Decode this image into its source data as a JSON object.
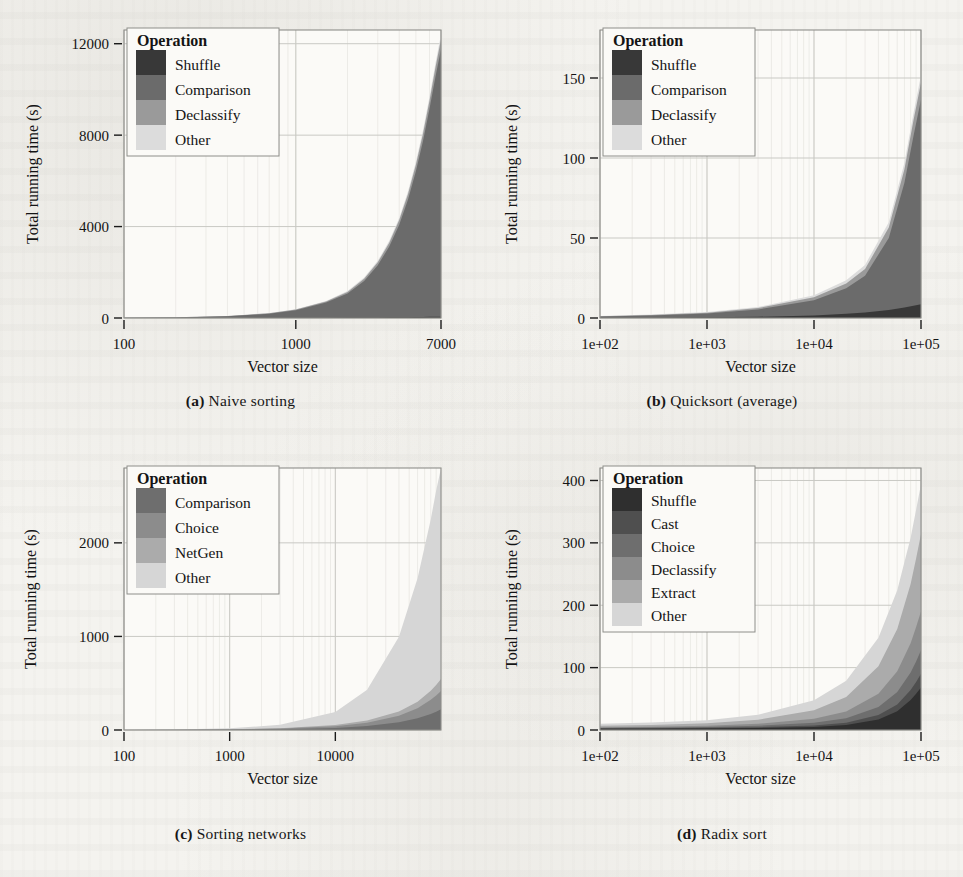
{
  "figure": {
    "background_color": "#f4f3ef",
    "ink_color": "#141414"
  },
  "palette": {
    "g1": "#383838",
    "g2": "#4e4e4e",
    "g3": "#6b6b6b",
    "g4": "#8a8a8a",
    "g5": "#ababab",
    "g6": "#d9d9d9",
    "grid": "#c9c9c4",
    "frame": "#8e8e8a"
  },
  "panels": [
    {
      "id": "a",
      "caption_marker": "(a)",
      "caption_text": "Naive sorting",
      "legend": {
        "title": "Operation",
        "entries": [
          {
            "label": "Shuffle",
            "color": "#383838"
          },
          {
            "label": "Comparison",
            "color": "#6b6b6b"
          },
          {
            "label": "Declassify",
            "color": "#9a9a9a"
          },
          {
            "label": "Other",
            "color": "#dcdcdc"
          }
        ]
      },
      "xlabel": "Vector size",
      "ylabel": "Total running time (s)",
      "xticks": [
        "100",
        "1000",
        "7000"
      ],
      "yticks": [
        "0",
        "4000",
        "8000",
        "12000"
      ]
    },
    {
      "id": "b",
      "caption_marker": "(b)",
      "caption_text": "Quicksort (average)",
      "legend": {
        "title": "Operation",
        "entries": [
          {
            "label": "Shuffle",
            "color": "#383838"
          },
          {
            "label": "Comparison",
            "color": "#6b6b6b"
          },
          {
            "label": "Declassify",
            "color": "#9a9a9a"
          },
          {
            "label": "Other",
            "color": "#dcdcdc"
          }
        ]
      },
      "xlabel": "Vector size",
      "ylabel": "Total running time (s)",
      "xticks": [
        "1e+02",
        "1e+03",
        "1e+04",
        "1e+05"
      ],
      "yticks": [
        "0",
        "50",
        "100",
        "150"
      ]
    },
    {
      "id": "c",
      "caption_marker": "(c)",
      "caption_text": "Sorting networks",
      "legend": {
        "title": "Operation",
        "entries": [
          {
            "label": "Comparison",
            "color": "#6e6e6e"
          },
          {
            "label": "Choice",
            "color": "#8c8c8c"
          },
          {
            "label": "NetGen",
            "color": "#ababab"
          },
          {
            "label": "Other",
            "color": "#d6d6d6"
          }
        ]
      },
      "xlabel": "Vector size",
      "ylabel": "Total running time (s)",
      "xticks": [
        "100",
        "1000",
        "10000"
      ],
      "yticks": [
        "0",
        "1000",
        "2000"
      ]
    },
    {
      "id": "d",
      "caption_marker": "(d)",
      "caption_text": "Radix sort",
      "legend": {
        "title": "Operation",
        "entries": [
          {
            "label": "Shuffle",
            "color": "#2f2f2f"
          },
          {
            "label": "Cast",
            "color": "#4f4f4f"
          },
          {
            "label": "Choice",
            "color": "#6e6e6e"
          },
          {
            "label": "Declassify",
            "color": "#8c8c8c"
          },
          {
            "label": "Extract",
            "color": "#ababab"
          },
          {
            "label": "Other",
            "color": "#d6d6d6"
          }
        ]
      },
      "xlabel": "Vector size",
      "ylabel": "Total running time (s)",
      "xticks": [
        "1e+02",
        "1e+03",
        "1e+04",
        "1e+05"
      ],
      "yticks": [
        "0",
        "100",
        "200",
        "300",
        "400"
      ]
    }
  ],
  "chart_data": [
    {
      "type": "area",
      "panel": "a",
      "title": "(a) Naive sorting",
      "xlabel": "Vector size",
      "ylabel": "Total running time (s)",
      "xscale": "log",
      "xlim": [
        100,
        7000
      ],
      "ylim": [
        0,
        12600
      ],
      "xticks": [
        100,
        1000,
        7000
      ],
      "yticks": [
        0,
        4000,
        8000,
        12000
      ],
      "grid": true,
      "legend": "inside-top-left",
      "legend_title": "Operation",
      "stacked": true,
      "x": [
        100,
        200,
        400,
        700,
        1000,
        1500,
        2000,
        2500,
        3000,
        3500,
        4000,
        4500,
        5000,
        5500,
        6000,
        6500,
        7000
      ],
      "series": [
        {
          "name": "Shuffle",
          "color": "#383838",
          "values": [
            1,
            2,
            4,
            7,
            10,
            14,
            18,
            22,
            26,
            30,
            34,
            38,
            42,
            46,
            50,
            54,
            58
          ]
        },
        {
          "name": "Comparison",
          "color": "#6b6b6b",
          "values": [
            10,
            25,
            70,
            180,
            330,
            660,
            1050,
            1600,
            2280,
            3100,
            4050,
            5150,
            6380,
            7700,
            9100,
            10500,
            11700
          ]
        },
        {
          "name": "Declassify",
          "color": "#9a9a9a",
          "values": [
            2,
            4,
            9,
            18,
            28,
            48,
            72,
            100,
            130,
            165,
            200,
            240,
            280,
            320,
            360,
            400,
            440
          ]
        },
        {
          "name": "Other",
          "color": "#dcdcdc",
          "values": [
            2,
            3,
            6,
            11,
            16,
            26,
            38,
            50,
            64,
            80,
            96,
            114,
            132,
            150,
            170,
            190,
            208
          ]
        }
      ],
      "totals_at_max_x": 12406
    },
    {
      "type": "area",
      "panel": "b",
      "title": "(b) Quicksort (average)",
      "xlabel": "Vector size",
      "ylabel": "Total running time (s)",
      "xscale": "log",
      "xlim": [
        100,
        100000
      ],
      "ylim": [
        0,
        180
      ],
      "xticks": [
        100,
        1000,
        10000,
        100000
      ],
      "xticklabels": [
        "1e+02",
        "1e+03",
        "1e+04",
        "1e+05"
      ],
      "yticks": [
        0,
        50,
        100,
        150
      ],
      "grid": true,
      "legend": "inside-top-left",
      "legend_title": "Operation",
      "stacked": true,
      "x": [
        100,
        300,
        1000,
        3000,
        10000,
        20000,
        30000,
        50000,
        70000,
        85000,
        100000
      ],
      "series": [
        {
          "name": "Shuffle",
          "color": "#383838",
          "values": [
            0.1,
            0.2,
            0.4,
            0.8,
            1.6,
            2.6,
            3.4,
            5.0,
            6.5,
            7.6,
            8.6
          ]
        },
        {
          "name": "Comparison",
          "color": "#6b6b6b",
          "values": [
            0.8,
            1.4,
            2.4,
            4.5,
            9.5,
            16.0,
            23.0,
            45.0,
            78.0,
            106.0,
            128.0
          ]
        },
        {
          "name": "Declassify",
          "color": "#9a9a9a",
          "values": [
            0.2,
            0.3,
            0.5,
            0.9,
            1.8,
            3.0,
            4.2,
            6.5,
            8.5,
            9.8,
            10.5
          ]
        },
        {
          "name": "Other",
          "color": "#dcdcdc",
          "values": [
            0.2,
            0.3,
            0.4,
            0.7,
            1.3,
            2.0,
            2.6,
            3.4,
            4.0,
            4.4,
            4.7
          ]
        }
      ],
      "totals_at_max_x": 151.8
    },
    {
      "type": "area",
      "panel": "c",
      "title": "(c) Sorting networks",
      "xlabel": "Vector size",
      "ylabel": "Total running time (s)",
      "xscale": "log",
      "xlim": [
        100,
        100000
      ],
      "ylim": [
        0,
        2800
      ],
      "xticks": [
        100,
        1000,
        10000
      ],
      "yticks": [
        0,
        1000,
        2000
      ],
      "grid": true,
      "legend": "inside-top-left",
      "legend_title": "Operation",
      "stacked": true,
      "x": [
        100,
        300,
        1000,
        3000,
        10000,
        20000,
        40000,
        60000,
        80000,
        90000,
        100000
      ],
      "series": [
        {
          "name": "Comparison",
          "color": "#6e6e6e",
          "values": [
            0.5,
            1.2,
            3.0,
            8.0,
            22.0,
            42.0,
            82.0,
            125.0,
            172.0,
            196.0,
            222.0
          ]
        },
        {
          "name": "Choice",
          "color": "#8c8c8c",
          "values": [
            0.4,
            1.0,
            2.6,
            7.0,
            19.0,
            36.0,
            70.0,
            108.0,
            150.0,
            172.0,
            196.0
          ]
        },
        {
          "name": "NetGen",
          "color": "#ababab",
          "values": [
            0.3,
            0.7,
            1.8,
            4.6,
            12.0,
            23.0,
            45.0,
            70.0,
            98.0,
            112.0,
            128.0
          ]
        },
        {
          "name": "Other",
          "color": "#d6d6d6",
          "values": [
            1.0,
            3.0,
            10.0,
            36.0,
            140.0,
            330.0,
            800.0,
            1320.0,
            1830.0,
            2080.0,
            2250.0
          ]
        }
      ],
      "totals_at_max_x": 2796
    },
    {
      "type": "area",
      "panel": "d",
      "title": "(d) Radix sort",
      "xlabel": "Vector size",
      "ylabel": "Total running time (s)",
      "xscale": "log",
      "xlim": [
        100,
        100000
      ],
      "ylim": [
        0,
        420
      ],
      "xticks": [
        100,
        1000,
        10000,
        100000
      ],
      "xticklabels": [
        "1e+02",
        "1e+03",
        "1e+04",
        "1e+05"
      ],
      "yticks": [
        0,
        100,
        200,
        300,
        400
      ],
      "grid": true,
      "legend": "inside-top-left",
      "legend_title": "Operation",
      "stacked": true,
      "x": [
        100,
        300,
        1000,
        3000,
        10000,
        20000,
        40000,
        60000,
        80000,
        90000,
        100000
      ],
      "series": [
        {
          "name": "Shuffle",
          "color": "#2f2f2f",
          "values": [
            2.0,
            2.2,
            2.6,
            3.2,
            5.0,
            8.0,
            17.0,
            30.0,
            48.0,
            58.0,
            68.0
          ]
        },
        {
          "name": "Cast",
          "color": "#4f4f4f",
          "values": [
            0.6,
            0.7,
            0.9,
            1.3,
            2.4,
            3.8,
            7.0,
            11.0,
            16.0,
            19.0,
            22.0
          ]
        },
        {
          "name": "Choice",
          "color": "#6e6e6e",
          "values": [
            0.8,
            1.0,
            1.4,
            2.2,
            4.2,
            7.0,
            13.0,
            20.0,
            28.0,
            33.0,
            38.0
          ]
        },
        {
          "name": "Declassify",
          "color": "#8c8c8c",
          "values": [
            1.0,
            1.3,
            1.9,
            3.2,
            6.5,
            11.0,
            21.0,
            33.0,
            47.0,
            55.0,
            62.0
          ]
        },
        {
          "name": "Extract",
          "color": "#ababab",
          "values": [
            2.4,
            2.9,
            4.0,
            6.5,
            13.5,
            23.0,
            44.0,
            68.0,
            95.0,
            110.0,
            124.0
          ]
        },
        {
          "name": "Other",
          "color": "#d6d6d6",
          "values": [
            3.2,
            3.8,
            5.0,
            8.0,
            16.0,
            26.0,
            46.0,
            62.0,
            74.0,
            78.0,
            80.0
          ]
        }
      ],
      "totals_at_max_x": 394
    }
  ]
}
